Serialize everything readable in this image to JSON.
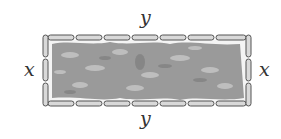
{
  "diagram": {
    "labels": {
      "top": "y",
      "bottom": "y",
      "left": "x",
      "right": "x"
    },
    "colors": {
      "fence_fill": "#d9d9d9",
      "fence_stroke": "#555555",
      "foliage": "#8f8f8f",
      "foliage_light": "#b5b5b5",
      "background": "#ffffff"
    }
  }
}
